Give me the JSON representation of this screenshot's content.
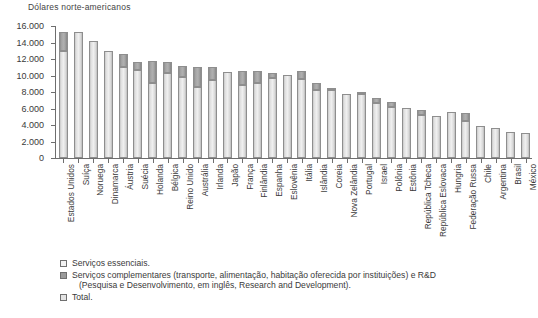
{
  "chart_data": {
    "type": "bar",
    "title": "",
    "ylabel": "Dólares norte-americanos",
    "xlabel": "",
    "ylim": [
      0,
      16000
    ],
    "ytick_labels": [
      "0",
      "2.000",
      "4.000",
      "6.000",
      "8.000",
      "10.000",
      "12.000",
      "14.000",
      "16.000"
    ],
    "ytick_values": [
      0,
      2000,
      4000,
      6000,
      8000,
      10000,
      12000,
      14000,
      16000
    ],
    "grid": false,
    "legend_position": "bottom-left",
    "stacked": true,
    "categories": [
      "Estados Unidos",
      "Suíça",
      "Noruega",
      "Dinamarca",
      "Áustria",
      "Suécia",
      "Holanda",
      "Bélgica",
      "Reino Unido",
      "Austrália",
      "Irlanda",
      "Japão",
      "França",
      "Finlândia",
      "Espanha",
      "Eslovênia",
      "Itália",
      "Islândia",
      "Coreia",
      "Nova Zelândia",
      "Portugal",
      "Israel",
      "Polônia",
      "Estônia",
      "República Tcheca",
      "República Eslovaca",
      "Hungria",
      "Federação Russa",
      "Chile",
      "Argentina",
      "Brasil",
      "México"
    ],
    "series": [
      {
        "name": "Serviços essenciais.",
        "values": [
          13000,
          15300,
          14150,
          12950,
          11000,
          10700,
          9050,
          10300,
          9800,
          8650,
          9400,
          10450,
          8900,
          9050,
          9750,
          10100,
          9600,
          8250,
          8250,
          7700,
          7700,
          6650,
          6150,
          6050,
          5250,
          5150,
          5550,
          4500,
          3900,
          3600,
          3200,
          3050
        ]
      },
      {
        "name": "Serviços complementares (transporte, alimentação, habitação oferecida por instituições) e R&D",
        "values": [
          2300,
          0,
          0,
          0,
          1600,
          900,
          2700,
          1300,
          1400,
          2350,
          1600,
          0,
          1700,
          1500,
          550,
          0,
          950,
          850,
          250,
          0,
          350,
          650,
          600,
          0,
          600,
          0,
          0,
          950,
          0,
          0,
          0,
          0
        ]
      }
    ],
    "totals": [
      15300,
      15300,
      14150,
      12950,
      12600,
      11600,
      11750,
      11600,
      11200,
      11000,
      11000,
      10450,
      10600,
      10550,
      10300,
      10100,
      10550,
      9100,
      8500,
      7700,
      8050,
      7300,
      6750,
      6050,
      5850,
      5150,
      5550,
      5450,
      3900,
      3600,
      3200,
      3050
    ]
  },
  "legend": {
    "items": [
      {
        "marker": "essenciais",
        "text": "Serviços essenciais.",
        "continuation": ""
      },
      {
        "marker": "complementares",
        "text": "Serviços complementares (transporte, alimentação, habitação oferecida por instituições) e R&D",
        "continuation": "(Pesquisa e Desenvolvimento, em inglês, Research and Development)."
      },
      {
        "marker": "total",
        "text": "Total.",
        "continuation": ""
      }
    ]
  }
}
